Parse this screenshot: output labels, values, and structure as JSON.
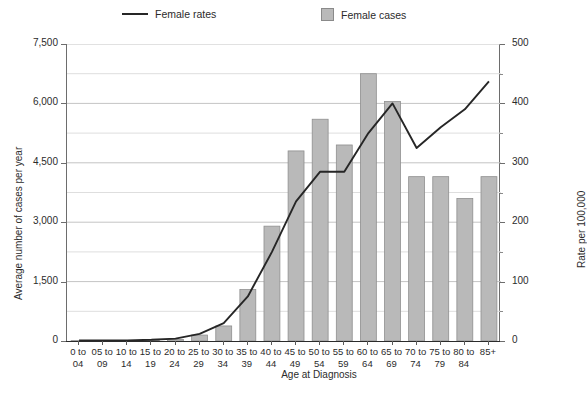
{
  "legend": {
    "items": [
      {
        "name": "line-series",
        "label": "Female rates",
        "marker": "line",
        "color": "#262626"
      },
      {
        "name": "bar-series",
        "label": "Female cases",
        "marker": "square",
        "color": "#b9b9b9"
      }
    ]
  },
  "axes": {
    "left_title": "Average number of cases per year",
    "right_title": "Rate per 100,000",
    "x_title": "Age at Diagnosis",
    "left_ticks": [
      "0",
      "1,500",
      "3,000",
      "4,500",
      "6,000",
      "7,500"
    ],
    "right_ticks": [
      "0",
      "100",
      "200",
      "300",
      "400",
      "500"
    ]
  },
  "chart_data": {
    "type": "bar",
    "title": "",
    "xlabel": "Age at Diagnosis",
    "ylabel": "Average number of cases per year",
    "y2label": "Rate per 100,000",
    "ylim": [
      0,
      7500
    ],
    "y2lim": [
      0,
      500
    ],
    "yticks": [
      0,
      1500,
      3000,
      4500,
      6000,
      7500
    ],
    "y2ticks": [
      0,
      100,
      200,
      300,
      400,
      500
    ],
    "grid": true,
    "minor_grid_step": 750,
    "legend_position": "top",
    "categories": [
      "0 to 04",
      "05 to 09",
      "10 to 14",
      "15 to 19",
      "20 to 24",
      "25 to 29",
      "30 to 34",
      "35 to 39",
      "40 to 44",
      "45 to 49",
      "50 to 54",
      "55 to 59",
      "60 to 64",
      "65 to 69",
      "70 to 74",
      "75 to 79",
      "80 to 84",
      "85+"
    ],
    "series": [
      {
        "name": "Female cases",
        "type": "bar",
        "axis": "left",
        "color": "#b9b9b9",
        "values": [
          10,
          10,
          15,
          20,
          40,
          150,
          380,
          1300,
          2900,
          4800,
          5600,
          4950,
          6750,
          6050,
          4150,
          4150,
          3600,
          4150
        ]
      },
      {
        "name": "Female rates",
        "type": "line",
        "axis": "right",
        "color": "#262626",
        "values": [
          1,
          1,
          1,
          2,
          4,
          12,
          30,
          75,
          150,
          235,
          285,
          285,
          350,
          400,
          325,
          360,
          390,
          437
        ]
      }
    ]
  }
}
